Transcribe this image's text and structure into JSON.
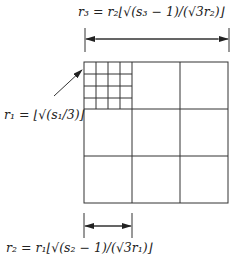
{
  "diagram": {
    "title_label_top": "r₃ = r₂⌊√(s₃ − 1)/(√3r₂)⌋",
    "label_left": "r₁ = ⌊√(s₁/3)⌋",
    "label_bottom": "r₂ = r₁⌊√(s₂ − 1)/(√3r₁)⌋",
    "outer_grid": {
      "rows": 3,
      "cols": 3
    },
    "inner_grid": {
      "rows": 4,
      "cols": 4,
      "location": "top-left cell"
    },
    "arrows": [
      {
        "name": "r3-span",
        "orientation": "horizontal",
        "spans": "full square width"
      },
      {
        "name": "r2-span",
        "orientation": "horizontal",
        "spans": "one outer cell width"
      },
      {
        "name": "r1-pointer",
        "orientation": "diagonal",
        "points_to": "top-left fine grid"
      }
    ],
    "colors": {
      "line": "#333333",
      "background": "#ffffff"
    }
  }
}
